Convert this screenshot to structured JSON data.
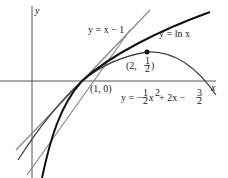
{
  "figure": {
    "axes": {
      "x_label": "x",
      "y_label": "y"
    },
    "curves": [
      {
        "name": "ln",
        "label": "y = ln x"
      },
      {
        "name": "tangent",
        "label": "y = x − 1"
      },
      {
        "name": "parabola",
        "label_prefix": "y = −",
        "label_frac1_num": "1",
        "label_frac1_den": "2",
        "label_mid": "x",
        "label_exp": "2",
        "label_mid2": " + 2x − ",
        "label_frac2_num": "3",
        "label_frac2_den": "2"
      }
    ],
    "points": [
      {
        "label": "(1, 0)"
      },
      {
        "label_prefix": "(2, ",
        "frac_num": "1",
        "frac_den": "2",
        "label_suffix": ")"
      }
    ]
  }
}
